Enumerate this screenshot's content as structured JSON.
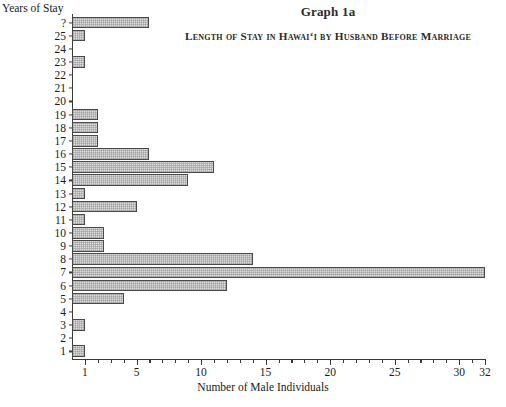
{
  "titles": {
    "graph_title": "Graph 1a",
    "graph_subtitle": "Length of Stay in Hawaiʻi by Husband Before Marriage"
  },
  "axes": {
    "y_axis_title": "Years of Stay",
    "x_axis_title": "Number of Male Individuals"
  },
  "chart_data": {
    "type": "bar",
    "orientation": "horizontal",
    "title": "Graph 1a",
    "subtitle": "Length of Stay in Hawaiʻi by Husband Before Marriage",
    "xlabel": "Number of Male Individuals",
    "ylabel": "Years of Stay",
    "xlim": [
      0,
      32
    ],
    "grid": false,
    "legend": "none",
    "xticks": [
      1,
      5,
      10,
      15,
      20,
      25,
      30,
      32
    ],
    "xtick_labels": [
      "1",
      "5",
      "10",
      "15",
      "20",
      "25",
      "30",
      "32"
    ],
    "minor_xticks": [
      2,
      3,
      4,
      6,
      7,
      8,
      9,
      11,
      12,
      13,
      14,
      16,
      17,
      18,
      19,
      21,
      22,
      23,
      24,
      26,
      27,
      28,
      29,
      31
    ],
    "categories": [
      "?",
      "25",
      "24",
      "23",
      "22",
      "21",
      "20",
      "19",
      "18",
      "17",
      "16",
      "15",
      "14",
      "13",
      "12",
      "11",
      "10",
      "9",
      "8",
      "7",
      "6",
      "5",
      "4",
      "3",
      "2",
      "1"
    ],
    "values": [
      6,
      1,
      0,
      1,
      0,
      0,
      0,
      2,
      2,
      2,
      6,
      11,
      9,
      1,
      5,
      1,
      2.5,
      2.5,
      14,
      32,
      12,
      4,
      0,
      1,
      0,
      1
    ],
    "bar_fill_color": "#dcdcdc",
    "bar_edge_color": "#4a4a4a",
    "background_color": "#ffffff"
  }
}
